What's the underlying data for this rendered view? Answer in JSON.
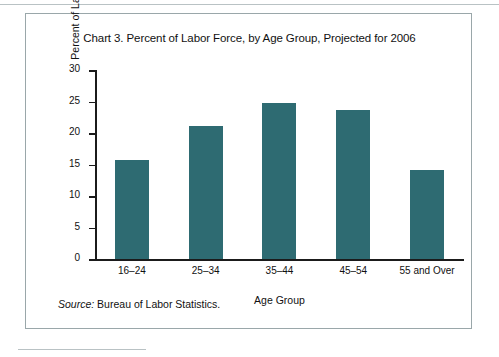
{
  "figure": {
    "title": "Chart 3. Percent of Labor Force, by Age Group, Projected for 2006",
    "source_label": "Source:",
    "source_text": "Bureau of Labor Statistics.",
    "bar_color": "#2E6B72",
    "axis_color": "#1B1B1B",
    "border_color": "#9AA7AA"
  },
  "chart_data": {
    "type": "bar",
    "title": "Chart 3. Percent of Labor Force, by Age Group, Projected for 2006",
    "xlabel": "Age Group",
    "ylabel": "Percent of Labor Force",
    "categories": [
      "16–24",
      "25–34",
      "35–44",
      "45–54",
      "55 and Over"
    ],
    "values": [
      15.7,
      21.1,
      24.8,
      23.7,
      14.2
    ],
    "ylim": [
      0,
      30
    ],
    "yticks": [
      0,
      5,
      10,
      15,
      20,
      25,
      30
    ],
    "ytick_labels": [
      "0",
      "5",
      "10",
      "15",
      "20",
      "25",
      "30"
    ],
    "grid": false,
    "legend": false,
    "series_color": "#2E6B72"
  }
}
